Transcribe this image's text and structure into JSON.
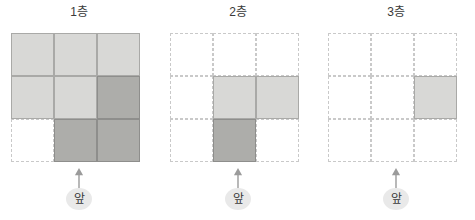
{
  "figure": {
    "grid_rows": 3,
    "grid_cols": 3,
    "colors": {
      "light_fill": "#d8d8d6",
      "light_stroke": "#a9a9a7",
      "dark_fill": "#adadaa",
      "dark_stroke": "#8e8e8c",
      "empty_stroke": "#c9c9c9",
      "text": "#3a3a3a",
      "badge_bg": "#e9e9e9",
      "background": "#ffffff"
    }
  },
  "panels": [
    {
      "title": "1층",
      "front_label": "앞",
      "arrow_icon": "arrow-up-icon",
      "cells": [
        [
          "light",
          "light",
          "light"
        ],
        [
          "light",
          "light",
          "dark"
        ],
        [
          "empty",
          "dark",
          "dark"
        ]
      ]
    },
    {
      "title": "2층",
      "front_label": "앞",
      "arrow_icon": "arrow-up-icon",
      "cells": [
        [
          "empty",
          "empty",
          "empty"
        ],
        [
          "empty",
          "light",
          "light"
        ],
        [
          "empty",
          "dark",
          "empty"
        ]
      ]
    },
    {
      "title": "3층",
      "front_label": "앞",
      "arrow_icon": "arrow-up-icon",
      "cells": [
        [
          "empty",
          "empty",
          "empty"
        ],
        [
          "empty",
          "empty",
          "light"
        ],
        [
          "empty",
          "empty",
          "empty"
        ]
      ]
    }
  ]
}
